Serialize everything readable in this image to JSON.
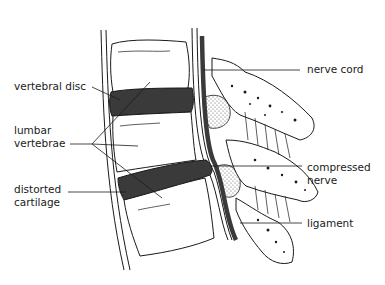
{
  "diagram": {
    "colors": {
      "ink": "#1a1a1a",
      "disc": "#3a3a3a",
      "background": "#ffffff"
    },
    "labels": {
      "vertebral_disc": "vertebral disc",
      "lumbar_vertebrae_line1": "lumbar",
      "lumbar_vertebrae_line2": "vertebrae",
      "distorted_cartilage_line1": "distorted",
      "distorted_cartilage_line2": "cartilage",
      "nerve_cord": "nerve cord",
      "compressed_nerve_line1": "compressed",
      "compressed_nerve_line2": "nerve",
      "ligament": "ligament"
    }
  }
}
